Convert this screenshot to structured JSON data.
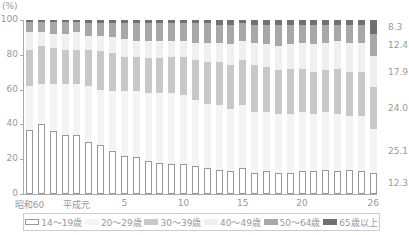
{
  "chart_data": {
    "type": "bar",
    "stacked": true,
    "title": "",
    "ylabel": "(%)",
    "xlabel": "",
    "ylim": [
      0,
      100
    ],
    "yticks": [
      0,
      20,
      40,
      60,
      80,
      100
    ],
    "x_tick_labels": [
      {
        "index": 0,
        "label": "昭和60"
      },
      {
        "index": 4,
        "label": "平成元"
      },
      {
        "index": 8,
        "label": "5"
      },
      {
        "index": 13,
        "label": "10"
      },
      {
        "index": 18,
        "label": "15"
      },
      {
        "index": 23,
        "label": "20"
      },
      {
        "index": 29,
        "label": "26"
      }
    ],
    "categories": [
      "昭和60",
      "61",
      "62",
      "63",
      "平成元",
      "2",
      "3",
      "4",
      "5",
      "6",
      "7",
      "8",
      "9",
      "10",
      "11",
      "12",
      "13",
      "14",
      "15",
      "16",
      "17",
      "18",
      "19",
      "20",
      "21",
      "22",
      "23",
      "24",
      "25",
      "26"
    ],
    "series": [
      {
        "name": "14～19歳",
        "color": "#ffffff",
        "border": "#999999",
        "values": [
          37,
          40,
          36,
          34,
          34,
          30,
          28,
          25,
          22,
          21,
          19,
          18,
          17,
          17,
          16,
          15,
          14,
          13,
          15,
          12,
          13,
          12,
          12,
          13,
          13,
          14,
          13,
          14,
          13,
          12.3
        ]
      },
      {
        "name": "20～29歳",
        "color": "#f4f4f4",
        "values": [
          25,
          23,
          27,
          29,
          29,
          32,
          32,
          34,
          37,
          38,
          39,
          40,
          41,
          40,
          38,
          37,
          37,
          36,
          36,
          35,
          34,
          34,
          34,
          34,
          33,
          33,
          33,
          31,
          32,
          25.1
        ]
      },
      {
        "name": "30～39歳",
        "color": "#c8c8c8",
        "values": [
          21,
          22,
          21,
          20,
          20,
          21,
          22,
          22,
          20,
          20,
          20,
          20,
          21,
          22,
          23,
          24,
          25,
          25,
          26,
          27,
          26,
          25,
          26,
          25,
          24,
          24,
          26,
          25,
          25,
          24.0
        ]
      },
      {
        "name": "40～49歳",
        "color": "#f0f0f0",
        "values": [
          10,
          8,
          8,
          9,
          10,
          8,
          9,
          9,
          10,
          9,
          10,
          10,
          9,
          9,
          10,
          11,
          11,
          12,
          11,
          13,
          13,
          14,
          14,
          15,
          16,
          16,
          16,
          17,
          17,
          17.9
        ]
      },
      {
        "name": "50～64歳",
        "color": "#a8a8a8",
        "values": [
          6,
          6,
          7,
          7,
          6,
          7,
          7,
          8,
          9,
          10,
          10,
          10,
          10,
          10,
          11,
          11,
          10,
          11,
          10,
          10,
          11,
          12,
          11,
          10,
          11,
          10,
          9,
          10,
          10,
          12.4
        ]
      },
      {
        "name": "65歳以上",
        "color": "#707070",
        "values": [
          1,
          1,
          1,
          1,
          1,
          2,
          2,
          2,
          2,
          2,
          2,
          2,
          2,
          2,
          2,
          2,
          3,
          3,
          2,
          3,
          3,
          3,
          3,
          3,
          3,
          3,
          3,
          3,
          3,
          8.3
        ]
      }
    ],
    "right_labels": [
      {
        "series": "65歳以上",
        "value": "8.3"
      },
      {
        "series": "50～64歳",
        "value": "12.4"
      },
      {
        "series": "40～49歳",
        "value": "17.9"
      },
      {
        "series": "30～39歳",
        "value": "24.0"
      },
      {
        "series": "20～29歳",
        "value": "25.1"
      },
      {
        "series": "14～19歳",
        "value": "12.3"
      }
    ],
    "legend_position": "bottom",
    "grid": false
  },
  "unit_label": "(%)",
  "legend": [
    {
      "label": "14～19歳"
    },
    {
      "label": "20～29歳"
    },
    {
      "label": "30～39歳"
    },
    {
      "label": "40～49歳"
    },
    {
      "label": "50～64歳"
    },
    {
      "label": "65歳以上"
    }
  ]
}
